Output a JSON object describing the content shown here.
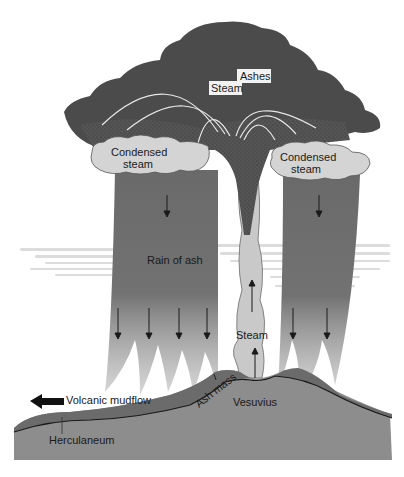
{
  "diagram": {
    "labels": {
      "ashes": "Ashes",
      "steam_top": "Steam",
      "condensed_steam_left_line1": "Condensed",
      "condensed_steam_left_line2": "steam",
      "condensed_steam_right_line1": "Condensed",
      "condensed_steam_right_line2": "steam",
      "rain_of_ash": "Rain of ash",
      "steam_column": "Steam",
      "volcanic_mudflow": "Volcanic mudflow",
      "ash_mass": "Ash mass",
      "vesuvius": "Vesuvius",
      "herculaneum": "Herculaneum"
    },
    "colors": {
      "eruption_cloud": "#4a4a4a",
      "ash_columns": "#6e6e6e",
      "condensed_steam": "#d4d4d4",
      "steam_column": "#c8c8c8",
      "ground": "#8a8a8a",
      "ash_layer": "#6a6a6a",
      "haze": "#d8d8d8"
    }
  }
}
